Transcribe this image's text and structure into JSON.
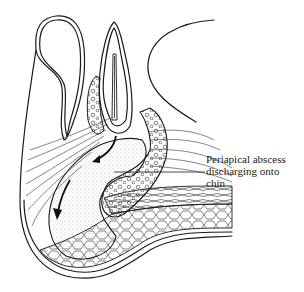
{
  "diagram": {
    "annotation": {
      "lines": [
        "Periapical abscess",
        "discharging onto",
        "chin"
      ],
      "target": "periapical abscess region"
    },
    "arrows": [
      {
        "name": "pus-flow-arrow-upper",
        "direction": "down-left"
      },
      {
        "name": "pus-flow-arrow-lower",
        "direction": "down"
      }
    ],
    "colors": {
      "line": "#1a1a1a",
      "background": "#ffffff",
      "stipple": "#888888"
    }
  }
}
